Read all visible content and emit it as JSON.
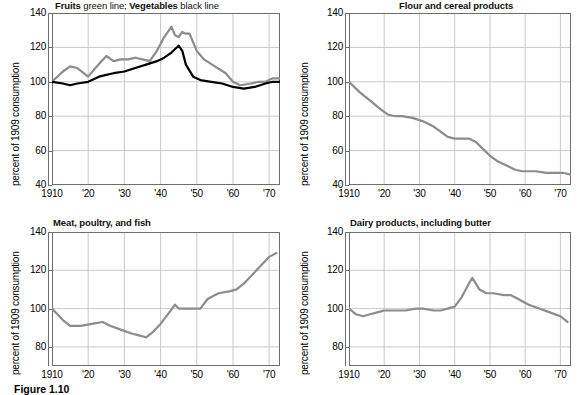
{
  "figure": {
    "caption": "Figure 1.10",
    "axis_label": "percent of 1909 consumption",
    "colors": {
      "fruits_line": "#8c8c8c",
      "vegetables_line": "#000000",
      "series_line": "#8c8c8c",
      "grid": "#c9c9c9",
      "axis": "#6e6e6e",
      "background": "#ffffff"
    }
  },
  "chart_data": [
    {
      "type": "line",
      "title": "Fruits green line; Vegetables black line",
      "title_parts": [
        {
          "text": "Fruits",
          "bold": true
        },
        {
          "text": " green line; ",
          "bold": false
        },
        {
          "text": "Vegetables",
          "bold": true
        },
        {
          "text": " black line",
          "bold": false
        }
      ],
      "xlabel": "",
      "ylabel": "percent of 1909 consumption",
      "xlim": [
        1910,
        1973
      ],
      "ylim": [
        40,
        140
      ],
      "yticks": [
        140,
        120,
        100,
        80,
        60,
        40
      ],
      "xticks": [
        1910,
        1920,
        1930,
        1940,
        1950,
        1960,
        1970
      ],
      "xticklabels": [
        "1910",
        "'20",
        "'30",
        "'40",
        "'50",
        "'60",
        "'70"
      ],
      "grid": true,
      "legend": "in-title",
      "series": [
        {
          "name": "Fruits",
          "color": "#8c8c8c",
          "x": [
            1910,
            1913,
            1915,
            1917,
            1920,
            1922,
            1925,
            1927,
            1929,
            1931,
            1933,
            1935,
            1937,
            1939,
            1941,
            1943,
            1944,
            1945,
            1946,
            1947,
            1948,
            1950,
            1952,
            1955,
            1958,
            1960,
            1962,
            1965,
            1967,
            1969,
            1971,
            1973
          ],
          "values": [
            100,
            106,
            109,
            108,
            103,
            108,
            115,
            112,
            113,
            113,
            114,
            113,
            112,
            118,
            126,
            132,
            127,
            126,
            129,
            128,
            128,
            118,
            113,
            109,
            105,
            100,
            98,
            99,
            100,
            100,
            102,
            102
          ]
        },
        {
          "name": "Vegetables",
          "color": "#000000",
          "x": [
            1910,
            1913,
            1915,
            1917,
            1920,
            1923,
            1925,
            1927,
            1930,
            1933,
            1936,
            1939,
            1941,
            1943,
            1945,
            1946,
            1947,
            1949,
            1951,
            1954,
            1957,
            1960,
            1963,
            1966,
            1969,
            1971,
            1973
          ],
          "values": [
            100,
            99,
            98,
            99,
            100,
            103,
            104,
            105,
            106,
            108,
            110,
            112,
            114,
            117,
            121,
            118,
            110,
            103,
            101,
            100,
            99,
            97,
            96,
            97,
            99,
            100,
            100
          ]
        }
      ]
    },
    {
      "type": "line",
      "title": "Flour and cereal products",
      "title_parts": [
        {
          "text": "Flour and cereal products",
          "bold": true
        }
      ],
      "xlabel": "",
      "ylabel": "percent of 1909 consumption",
      "xlim": [
        1910,
        1973
      ],
      "ylim": [
        40,
        140
      ],
      "yticks": [
        140,
        120,
        100,
        80,
        60,
        40
      ],
      "xticks": [
        1910,
        1920,
        1930,
        1940,
        1950,
        1960,
        1970
      ],
      "xticklabels": [
        "1910",
        "'20",
        "'30",
        "'40",
        "'50",
        "'60",
        "'70"
      ],
      "grid": true,
      "series": [
        {
          "name": "Flour and cereal products",
          "color": "#8c8c8c",
          "x": [
            1910,
            1913,
            1916,
            1919,
            1921,
            1923,
            1925,
            1928,
            1931,
            1934,
            1936,
            1938,
            1940,
            1942,
            1944,
            1946,
            1948,
            1950,
            1952,
            1955,
            1957,
            1959,
            1961,
            1963,
            1966,
            1969,
            1971,
            1973
          ],
          "values": [
            100,
            94,
            89,
            84,
            81,
            80,
            80,
            79,
            77,
            74,
            71,
            68,
            67,
            67,
            67,
            65,
            61,
            57,
            54,
            51,
            49,
            48,
            48,
            48,
            47,
            47,
            47,
            46
          ]
        }
      ]
    },
    {
      "type": "line",
      "title": "Meat, poultry, and fish",
      "title_parts": [
        {
          "text": "Meat, poultry, and fish",
          "bold": true
        }
      ],
      "xlabel": "",
      "ylabel": "percent of 1909 consumption",
      "xlim": [
        1910,
        1973
      ],
      "ylim": [
        70,
        140
      ],
      "yticks": [
        140,
        120,
        100,
        80
      ],
      "xticks": [
        1910,
        1920,
        1930,
        1940,
        1950,
        1960,
        1970
      ],
      "xticklabels": [
        "1910",
        "'20",
        "'30",
        "'40",
        "'50",
        "'60",
        "'70"
      ],
      "grid": true,
      "series": [
        {
          "name": "Meat, poultry, and fish",
          "color": "#8c8c8c",
          "x": [
            1910,
            1913,
            1915,
            1918,
            1921,
            1924,
            1926,
            1929,
            1932,
            1934,
            1936,
            1938,
            1940,
            1942,
            1944,
            1945,
            1947,
            1949,
            1951,
            1953,
            1956,
            1959,
            1961,
            1963,
            1965,
            1968,
            1970,
            1972
          ],
          "values": [
            100,
            94,
            91,
            91,
            92,
            93,
            91,
            89,
            87,
            86,
            85,
            88,
            92,
            97,
            102,
            100,
            100,
            100,
            100,
            105,
            108,
            109,
            110,
            113,
            117,
            123,
            127,
            129
          ]
        }
      ]
    },
    {
      "type": "line",
      "title": "Dairy products, including butter",
      "title_parts": [
        {
          "text": "Dairy products, including butter",
          "bold": true
        }
      ],
      "xlabel": "",
      "ylabel": "percent of 1909 consumption",
      "xlim": [
        1910,
        1973
      ],
      "ylim": [
        70,
        140
      ],
      "yticks": [
        140,
        120,
        100,
        80
      ],
      "xticks": [
        1910,
        1920,
        1930,
        1940,
        1950,
        1960,
        1970
      ],
      "xticklabels": [
        "1910",
        "'20",
        "'30",
        "'40",
        "'50",
        "'60",
        "'70"
      ],
      "grid": true,
      "series": [
        {
          "name": "Dairy products, including butter",
          "color": "#8c8c8c",
          "x": [
            1910,
            1912,
            1914,
            1916,
            1918,
            1920,
            1923,
            1926,
            1929,
            1931,
            1934,
            1936,
            1938,
            1940,
            1942,
            1944,
            1945,
            1947,
            1949,
            1951,
            1954,
            1956,
            1958,
            1961,
            1964,
            1967,
            1970,
            1972
          ],
          "values": [
            100,
            97,
            96,
            97,
            98,
            99,
            99,
            99,
            100,
            100,
            99,
            99,
            100,
            101,
            106,
            113,
            116,
            110,
            108,
            108,
            107,
            107,
            105,
            102,
            100,
            98,
            96,
            93
          ]
        }
      ]
    }
  ]
}
